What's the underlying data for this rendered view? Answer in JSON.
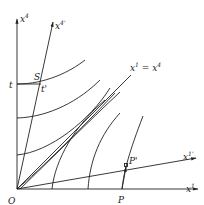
{
  "diagram": {
    "type": "spacetime-diagram",
    "axes": {
      "x4": {
        "label": "x",
        "sup": "4"
      },
      "x4p": {
        "label": "x",
        "sup": "4'"
      },
      "x1": {
        "label": "x",
        "sup": "1"
      },
      "x1p": {
        "label": "x",
        "sup": "1'"
      }
    },
    "light_line_label": {
      "lhs": "x",
      "lhs_sup": "1",
      "eq": " = ",
      "rhs": "x",
      "rhs_sup": "4"
    },
    "points": {
      "origin": "O",
      "t": "t",
      "S": "S",
      "t_prime": "t'",
      "P": "P",
      "P_prime": "P'"
    },
    "colors": {
      "ink": "#222222",
      "background": "#ffffff"
    }
  }
}
